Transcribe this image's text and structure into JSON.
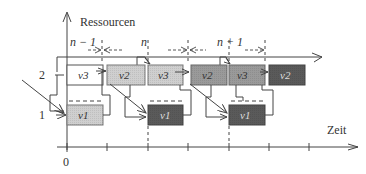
{
  "axes": {
    "y_label": "Ressourcen",
    "x_label": "Zeit",
    "origin_label": "0",
    "resource_labels": [
      "1",
      "2"
    ]
  },
  "periods": [
    {
      "label": "n − 1"
    },
    {
      "label": "n"
    },
    {
      "label": "n + 1"
    }
  ],
  "row2_tasks": [
    {
      "label": "v3",
      "fill": "#ffffff"
    },
    {
      "label": "v2",
      "fill": "#cfcfcf"
    },
    {
      "label": "v3",
      "fill": "#cfcfcf"
    },
    {
      "label": "v2",
      "fill": "#9a9a9a"
    },
    {
      "label": "v3",
      "fill": "#9a9a9a"
    },
    {
      "label": "v2",
      "fill": "#5a5a5a"
    }
  ],
  "row1_tasks": [
    {
      "label": "v1",
      "fill": "#cfcfcf"
    },
    {
      "label": "v1",
      "fill": "#5a5a5a"
    },
    {
      "label": "v1",
      "fill": "#5a5a5a"
    }
  ],
  "colors": {
    "line": "#444444",
    "light": "#cfcfcf",
    "mid": "#9a9a9a",
    "dark": "#5a5a5a"
  }
}
